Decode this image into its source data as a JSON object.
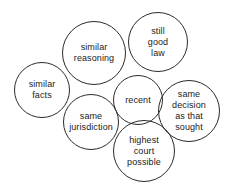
{
  "diagram": {
    "type": "venn-style-circle-cluster",
    "background_color": "#ffffff",
    "stroke_color": "#2b2b2b",
    "text_color": "#1a1a1a",
    "circles": [
      {
        "id": "similar-facts",
        "label": "similar\nfacts",
        "cx": 42,
        "cy": 90,
        "r": 28
      },
      {
        "id": "similar-reasoning",
        "label": "similar\nreasoning",
        "cx": 94,
        "cy": 53,
        "r": 32
      },
      {
        "id": "still-good-law",
        "label": "still\ngood\nlaw",
        "cx": 158,
        "cy": 42,
        "r": 30
      },
      {
        "id": "recent",
        "label": "recent",
        "cx": 138,
        "cy": 100,
        "r": 25
      },
      {
        "id": "same-decision-as-that-sought",
        "label": "same\ndecision\nas that\nsought",
        "cx": 189,
        "cy": 111,
        "r": 31
      },
      {
        "id": "same-jurisdiction",
        "label": "same\njurisdiction",
        "cx": 91,
        "cy": 122,
        "r": 28
      },
      {
        "id": "highest-court-possible",
        "label": "highest\ncourt\npossible",
        "cx": 144,
        "cy": 151,
        "r": 31
      }
    ]
  }
}
